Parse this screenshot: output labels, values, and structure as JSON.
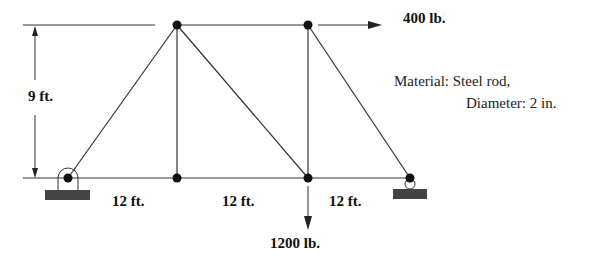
{
  "figure": {
    "dimensions": {
      "height": "9 ft.",
      "span1": "12 ft.",
      "span2": "12 ft.",
      "span3": "12 ft."
    },
    "loads": {
      "horizontal": "400 lb.",
      "vertical": "1200 lb."
    },
    "material": {
      "line1": "Material: Steel rod,",
      "line2": "Diameter: 2 in."
    },
    "colors": {
      "line": "#333333",
      "node": "#111111",
      "support": "#444444"
    }
  }
}
